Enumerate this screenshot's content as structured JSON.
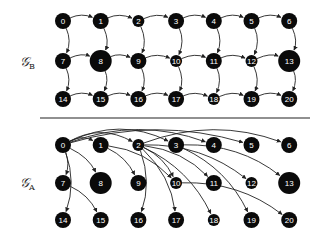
{
  "colors": {
    "node_fill": "#0a0a0a",
    "edge": "#222222",
    "label_text": "#ffffff",
    "divider": "#222222"
  },
  "grid": {
    "cols": 7,
    "x0": 63,
    "dx": 37.7
  },
  "graphs": [
    {
      "id": "B",
      "label": "𝒢",
      "subscript": "B",
      "label_pos": [
        20,
        66
      ],
      "rows_y": [
        21,
        61,
        99
      ],
      "style": "grid",
      "edges": [
        [
          0,
          1
        ],
        [
          1,
          2
        ],
        [
          2,
          3
        ],
        [
          3,
          4
        ],
        [
          4,
          5
        ],
        [
          5,
          6
        ],
        [
          7,
          8
        ],
        [
          8,
          9
        ],
        [
          9,
          10
        ],
        [
          10,
          11
        ],
        [
          11,
          12
        ],
        [
          12,
          13
        ],
        [
          14,
          15
        ],
        [
          15,
          16
        ],
        [
          16,
          17
        ],
        [
          17,
          18
        ],
        [
          18,
          19
        ],
        [
          19,
          20
        ],
        [
          0,
          7
        ],
        [
          1,
          8
        ],
        [
          2,
          9
        ],
        [
          3,
          10
        ],
        [
          4,
          11
        ],
        [
          5,
          12
        ],
        [
          6,
          13
        ],
        [
          7,
          14
        ],
        [
          8,
          15
        ],
        [
          9,
          16
        ],
        [
          10,
          17
        ],
        [
          11,
          18
        ],
        [
          12,
          19
        ],
        [
          13,
          20
        ]
      ]
    },
    {
      "id": "A",
      "label": "𝒢",
      "subscript": "A",
      "label_pos": [
        20,
        187
      ],
      "rows_y": [
        145,
        183,
        220
      ],
      "style": "dag",
      "edges": [
        [
          0,
          1
        ],
        [
          0,
          2
        ],
        [
          0,
          3
        ],
        [
          0,
          4
        ],
        [
          0,
          5
        ],
        [
          0,
          7
        ],
        [
          0,
          8
        ],
        [
          0,
          14
        ],
        [
          1,
          9
        ],
        [
          1,
          10
        ],
        [
          2,
          6
        ],
        [
          2,
          10
        ],
        [
          2,
          11
        ],
        [
          2,
          12
        ],
        [
          2,
          16
        ],
        [
          2,
          17
        ],
        [
          2,
          18
        ],
        [
          3,
          13
        ],
        [
          3,
          19
        ],
        [
          7,
          15
        ],
        [
          10,
          20
        ]
      ]
    }
  ],
  "nodes": [
    {
      "id": 0,
      "label": "0",
      "size": "normal"
    },
    {
      "id": 1,
      "label": "1",
      "size": "normal"
    },
    {
      "id": 2,
      "label": "2",
      "size": "small"
    },
    {
      "id": 3,
      "label": "3",
      "size": "normal"
    },
    {
      "id": 4,
      "label": "4",
      "size": "normal"
    },
    {
      "id": 5,
      "label": "5",
      "size": "normal"
    },
    {
      "id": 6,
      "label": "6",
      "size": "normal"
    },
    {
      "id": 7,
      "label": "7",
      "size": "normal"
    },
    {
      "id": 8,
      "label": "8",
      "size": "large"
    },
    {
      "id": 9,
      "label": "9",
      "size": "normal"
    },
    {
      "id": 10,
      "label": "10",
      "size": "small"
    },
    {
      "id": 11,
      "label": "11",
      "size": "normal"
    },
    {
      "id": 12,
      "label": "12",
      "size": "small"
    },
    {
      "id": 13,
      "label": "13",
      "size": "large"
    },
    {
      "id": 14,
      "label": "14",
      "size": "normal"
    },
    {
      "id": 15,
      "label": "15",
      "size": "normal"
    },
    {
      "id": 16,
      "label": "16",
      "size": "normal"
    },
    {
      "id": 17,
      "label": "17",
      "size": "normal"
    },
    {
      "id": 18,
      "label": "18",
      "size": "small"
    },
    {
      "id": 19,
      "label": "19",
      "size": "normal"
    },
    {
      "id": 20,
      "label": "20",
      "size": "normal"
    }
  ],
  "radii": {
    "small": 6,
    "normal": 8,
    "large": 11
  },
  "divider": {
    "x1": 40,
    "x2": 310,
    "y": 118
  }
}
